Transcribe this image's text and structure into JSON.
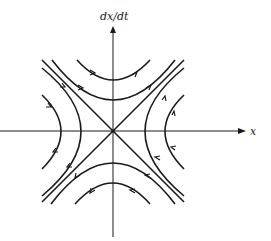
{
  "diagram": {
    "type": "phase-portrait",
    "y_axis_label": "dx/dt",
    "x_axis_label": "x",
    "equilibrium": "saddle at origin",
    "trajectories": {
      "upper_hyperbolas": 2,
      "lower_hyperbolas": 2,
      "left_hyperbolas": 2,
      "right_hyperbolas": 2,
      "separatrices": 2
    }
  }
}
